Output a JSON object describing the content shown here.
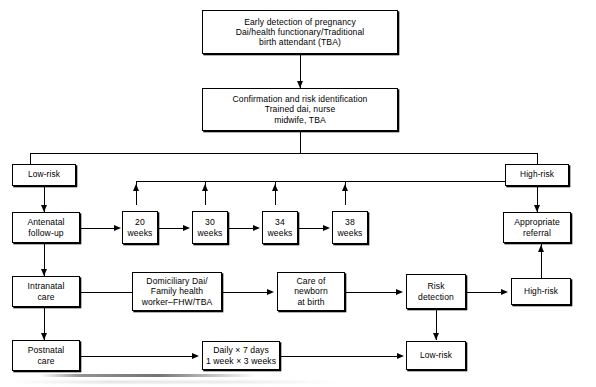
{
  "diagram": {
    "nodes": {
      "early_detection": "Early detection of pregnancy\nDai/health functionary/Traditional\nbirth attendant (TBA)",
      "confirmation": "Confirmation and risk identification\nTrained dai, nurse\nmidwife, TBA",
      "low_risk_top": "Low-risk",
      "high_risk_top": "High-risk",
      "antenatal": "Antenatal\nfollow-up",
      "weeks_20": "20\nweeks",
      "weeks_30": "30\nweeks",
      "weeks_34": "34\nweeks",
      "weeks_38": "38\nweeks",
      "appropriate_referral": "Appropriate\nreferral",
      "intranatal": "Intranatal\ncare",
      "domiciliary": "Domiciliary Dai/\nFamily health\nworker–FHW/TBA",
      "care_newborn": "Care of\nnewborn\nat birth",
      "risk_detection": "Risk\ndetection",
      "high_risk_mid": "High-risk",
      "postnatal": "Postnatal\ncare",
      "daily_schedule": "Daily × 7 days\n1 week × 3 weeks",
      "low_risk_bottom": "Low-risk"
    },
    "colors": {
      "stroke": "#000000",
      "background": "#ffffff",
      "text": "#000000"
    }
  }
}
